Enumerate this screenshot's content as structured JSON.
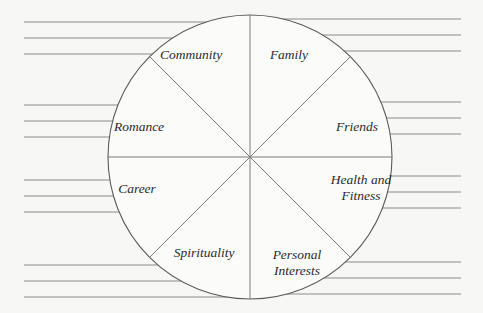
{
  "diagram": {
    "type": "wheel-of-life",
    "center": [
      250,
      157
    ],
    "radius": 142,
    "colors": {
      "background": "#f7f7f5",
      "outline": "#5a5a5a",
      "lines": "#8a8a8a",
      "text": "#2a2a2a"
    },
    "segments": [
      {
        "id": "community",
        "label": "Community",
        "pos": [
          191,
          55
        ]
      },
      {
        "id": "family",
        "label": "Family",
        "pos": [
          289,
          55
        ]
      },
      {
        "id": "friends",
        "label": "Friends",
        "pos": [
          357,
          127
        ]
      },
      {
        "id": "health-and-fitness",
        "label": "Health and\nFitness",
        "pos": [
          361,
          188
        ]
      },
      {
        "id": "personal-interests",
        "label": "Personal\nInterests",
        "pos": [
          297,
          263
        ]
      },
      {
        "id": "spirituality",
        "label": "Spirituality",
        "pos": [
          204,
          253
        ]
      },
      {
        "id": "career",
        "label": "Career",
        "pos": [
          137,
          189
        ]
      },
      {
        "id": "romance",
        "label": "Romance",
        "pos": [
          139,
          127
        ]
      }
    ],
    "writing_lines": {
      "left": {
        "x_start": 24,
        "groups": [
          [
            22,
            38,
            54
          ],
          [
            105,
            121,
            137
          ],
          [
            180,
            196,
            212
          ],
          [
            265,
            281,
            297
          ]
        ]
      },
      "right": {
        "x_end": 461,
        "groups": [
          [
            19,
            35,
            51
          ],
          [
            102,
            118,
            134
          ],
          [
            176,
            192,
            208
          ],
          [
            262,
            278,
            294
          ]
        ]
      }
    }
  }
}
